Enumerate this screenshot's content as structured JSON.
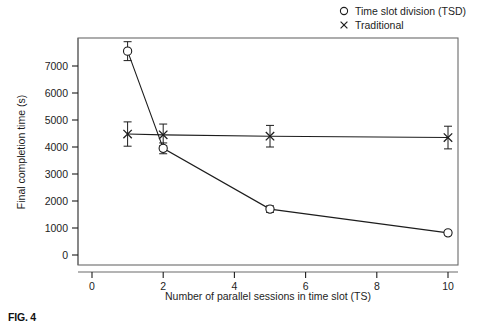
{
  "figure": {
    "caption": "FIG. 4",
    "background_color": "#ffffff",
    "ink_color": "#1d1d1d"
  },
  "legend": {
    "position": "top-right",
    "entries": [
      {
        "marker": "circle-marker-icon",
        "label": "Time slot division (TSD)"
      },
      {
        "marker": "cross-marker-icon",
        "label": "Traditional"
      }
    ]
  },
  "chart_data": {
    "type": "line",
    "title": "",
    "xlabel": "Number of parallel sessions in time slot (TS)",
    "ylabel": "Final completion time (s)",
    "xlim": [
      0,
      10.6
    ],
    "ylim": [
      0,
      7950
    ],
    "grid": false,
    "xticks": [
      0,
      2,
      4,
      6,
      8,
      10
    ],
    "xtick_labels": [
      "0",
      "2",
      "4",
      "6",
      "8",
      "10"
    ],
    "yticks": [
      0,
      1000,
      2000,
      3000,
      4000,
      5000,
      6000,
      7000
    ],
    "ytick_labels": [
      "0",
      "1000",
      "2000",
      "3000",
      "4000",
      "5000",
      "6000",
      "7000"
    ],
    "x": [
      1,
      2,
      5,
      10
    ],
    "series": [
      {
        "name": "Time slot division (TSD)",
        "marker": "circle",
        "x": [
          1,
          2,
          5,
          10
        ],
        "values": [
          7550,
          3950,
          1700,
          820
        ],
        "errors": [
          350,
          200,
          120,
          80
        ],
        "color": "#1d1d1d"
      },
      {
        "name": "Traditional",
        "marker": "cross",
        "x": [
          1,
          2,
          5,
          10
        ],
        "values": [
          4480,
          4450,
          4400,
          4350
        ],
        "errors": [
          450,
          400,
          400,
          420
        ],
        "color": "#1d1d1d"
      }
    ]
  },
  "plot_geometry": {
    "left": 78,
    "right": 458,
    "top": 38,
    "bottom": 265,
    "x_zero_px": 92,
    "x_unit_px": 35.6,
    "y_zero_px": 255,
    "y_unit_px": 0.027
  }
}
